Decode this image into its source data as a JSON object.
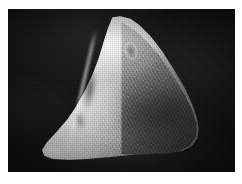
{
  "page": {
    "kind": "photographic-plate",
    "background_color": "#ffffff",
    "width_px": 242,
    "height_px": 184
  },
  "photo": {
    "caption": "",
    "alt_description": "Black-and-white photograph of a triangular pointed stone artifact (lithic biface) photographed against a black background",
    "subject": "stone artifact",
    "orientation": "apex up",
    "background_color": "#0d0d0d",
    "highlight_color": "#f2f2f2",
    "midtone_color": "#8f8f8f",
    "shadow_color": "#3a3a3a",
    "frame": {
      "left_px": 8,
      "top_px": 9,
      "width_px": 227,
      "height_px": 163
    }
  },
  "artifact": {
    "name": "lithic-biface",
    "apex_point": "top-center",
    "secondary_point": "lower-left",
    "features": [
      "medial-ridge",
      "flake-scar-upper",
      "flake-scar-lower",
      "notch-near-apex",
      "cortex-texture"
    ]
  }
}
